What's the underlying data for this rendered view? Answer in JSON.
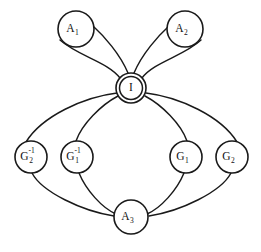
{
  "diagram": {
    "background_color": "#ffffff",
    "line_color": "#1a1a1a",
    "nodes": [
      {
        "id": "A1",
        "base": "A",
        "sub": "1",
        "sup": "",
        "cx": 76,
        "cy": 29,
        "r": 18,
        "double": false
      },
      {
        "id": "A2",
        "base": "A",
        "sub": "2",
        "sup": "",
        "cx": 185,
        "cy": 29,
        "r": 18,
        "double": false
      },
      {
        "id": "I",
        "base": "I",
        "sub": "",
        "sup": "",
        "cx": 131,
        "cy": 88,
        "r": 15,
        "double": true,
        "inner_r": 11.5
      },
      {
        "id": "G2inv",
        "base": "G",
        "sub": "2",
        "sup": "-1",
        "cx": 31,
        "cy": 157,
        "r": 16,
        "double": false
      },
      {
        "id": "G1inv",
        "base": "G",
        "sub": "1",
        "sup": "-1",
        "cx": 77,
        "cy": 157,
        "r": 16,
        "double": false
      },
      {
        "id": "G1",
        "base": "G",
        "sub": "1",
        "sup": "",
        "cx": 186,
        "cy": 157,
        "r": 16,
        "double": false
      },
      {
        "id": "G2",
        "base": "G",
        "sub": "2",
        "sup": "",
        "cx": 232,
        "cy": 157,
        "r": 16,
        "double": false
      },
      {
        "id": "A3",
        "base": "A",
        "sub": "3",
        "sup": "",
        "cx": 131,
        "cy": 217,
        "r": 17,
        "double": false
      }
    ],
    "edges": [
      {
        "id": "e-I-A1-outer",
        "from": "I",
        "to": "A1",
        "path": "M 120 78 C 108 62 78 56 60 40"
      },
      {
        "id": "e-I-A1-inner",
        "from": "I",
        "to": "A1",
        "path": "M 128 73 C 120 54 104 36 93 26"
      },
      {
        "id": "e-I-A2-outer",
        "from": "I",
        "to": "A2",
        "path": "M 142 78 C 154 62 184 56 201 40"
      },
      {
        "id": "e-I-A2-inner",
        "from": "I",
        "to": "A2",
        "path": "M 134 73 C 142 54 158 36 169 26"
      },
      {
        "id": "e-I-G2inv",
        "from": "I",
        "to": "G2inv",
        "path": "M 117 93 C 84 97 42 116 26 142"
      },
      {
        "id": "e-I-G1inv",
        "from": "I",
        "to": "G1inv",
        "path": "M 118 96 C 101 105 82 124 76 141"
      },
      {
        "id": "e-I-G1",
        "from": "I",
        "to": "G1",
        "path": "M 145 96 C 162 105 181 124 187 141"
      },
      {
        "id": "e-I-G2",
        "from": "I",
        "to": "G2",
        "path": "M 146 93 C 179 97 221 116 237 142"
      },
      {
        "id": "e-G2inv-A3",
        "from": "G2inv",
        "to": "A3",
        "path": "M 32 173 C 42 192 82 211 114 216"
      },
      {
        "id": "e-G1inv-A3",
        "from": "G1inv",
        "to": "A3",
        "path": "M 79 173 C 86 190 102 208 116 214"
      },
      {
        "id": "e-G1-A3",
        "from": "G1",
        "to": "A3",
        "path": "M 184 173 C 177 190 161 208 147 214"
      },
      {
        "id": "e-G2-A3",
        "from": "G2",
        "to": "A3",
        "path": "M 231 173 C 221 192 181 211 149 216"
      }
    ]
  }
}
